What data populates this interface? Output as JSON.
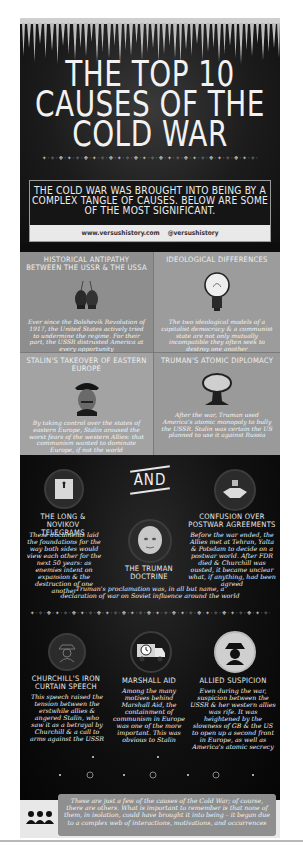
{
  "header": {
    "title_lines": [
      "THE TOP 10",
      "CAUSES OF THE",
      "COLD WAR"
    ],
    "intro": "THE COLD WAR WAS BROUGHT INTO BEING BY A COMPLEX TANGLE OF CAUSES. BELOW ARE SOME OF THE MOST SIGNIFICANT.",
    "website": "www.versushistory.com",
    "handle": "@versushistory"
  },
  "grid": [
    {
      "title": "Historical Antipathy Between the USSR & the USSA",
      "icon": "boxing-gloves-icon",
      "body": "Ever since the Bolshevik Revolution of 1917, the United States actively tried to undermine the regime. For their part, the USSR distrusted America at every opportunity"
    },
    {
      "title": "Ideological Differences",
      "icon": "lightbulb-icon",
      "body": "The two ideological models of a capitalist democracy & a communist state are not only mutually incompatible they often seek to destroy one another"
    },
    {
      "title": "Stalin's Takeover of Eastern Europe",
      "icon": "stalin-portrait-icon",
      "body": "By taking control over the states of eastern Europe, Stalin aroused the worst fears of the western Allies: that communism wanted to dominate Europe, if not the world"
    },
    {
      "title": "Truman's Atomic Diplomacy",
      "icon": "mushroom-cloud-icon",
      "body": "After the war, Truman used America's atomic monopoly to bully the USSR. Stalin was certain the US planned to use it against Russia"
    }
  ],
  "dark": {
    "and_label": "AND",
    "long": {
      "title_line1": "The Long &",
      "title_line2": "Novikov Telegrams",
      "icon": "document-icon",
      "body": "These documents laid the foundations for the way both sides would view each other for the next 50 years: as enemies intent on expansion & the destruction of one another"
    },
    "confusion": {
      "title_line1": "Confusion Over",
      "title_line2": "Postwar Agreements",
      "icon": "handshake-icon",
      "body": "Before the war ended, the Allies met at Tehran, Yalta & Potsdam to decide on a postwar world. After FDR died & Churchill was ousted, it became unclear what, if anything, had been agreed"
    },
    "truman": {
      "title_line1": "The Truman",
      "title_line2": "Doctrine",
      "icon": "truman-portrait-icon",
      "body": "Truman's proclamation was, in all but name, a declaration of war on Soviet influence around the world"
    },
    "churchill": {
      "title_line1": "Churchill's Iron",
      "title_line2": "Curtain Speech",
      "icon": "spy-silhouette-icon",
      "body": "This speech raised the tension between the erstwhile allies & angered Stalin, who saw it as a betrayal by Churchill & a call to arms against the USSR"
    },
    "marshall": {
      "title_line1": "Marshall Aid",
      "icon": "delivery-truck-clock-icon",
      "body": "Among the many motives behind Marshall Aid, the containment of communism in Europe was one of the more important. This was obvious to Stalin"
    },
    "allied": {
      "title_line1": "Allied Suspicion",
      "icon": "spy-hat-icon",
      "body": "Even during the war, suspicion between the USSR & her western allies was rife. It was heightened by the slowness of GB & the US to open up a second front in Europe, as well as America's atomic secrecy"
    }
  },
  "footer": {
    "icon": "group-people-icon",
    "text": "These are just a few of the causes of the Cold War; of course, there are others. What is important to remember is that none of them, in isolation, could have brought it into being – it began due to a complex web of interactions, motivations, and occurrences"
  },
  "colors": {
    "background": "#0d0d0d",
    "panel_grey": "#9a9a9a",
    "text": "#f2f2f2",
    "url_bar": "#e9e9e9"
  }
}
